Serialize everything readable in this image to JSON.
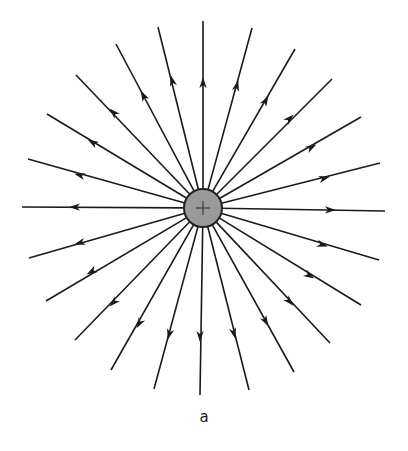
{
  "figure": {
    "caption": "a",
    "charge": {
      "sign": "+",
      "center": [
        203,
        208
      ],
      "radius": 19,
      "fill": "#9a9a9a",
      "stroke": "#222222"
    },
    "line_color": "#1a1a1a",
    "field_lines": [
      {
        "end": [
          203,
          21
        ],
        "arrow": [
          203,
          82
        ]
      },
      {
        "end": [
          158,
          27
        ],
        "arrow": [
          172,
          80
        ]
      },
      {
        "end": [
          252,
          28
        ],
        "arrow": [
          237,
          85
        ]
      },
      {
        "end": [
          116,
          44
        ],
        "arrow": [
          143,
          95
        ]
      },
      {
        "end": [
          295,
          49
        ],
        "arrow": [
          266,
          100
        ]
      },
      {
        "end": [
          76,
          75
        ],
        "arrow": [
          113,
          112
        ]
      },
      {
        "end": [
          332,
          79
        ],
        "arrow": [
          290,
          118
        ]
      },
      {
        "end": [
          47,
          114
        ],
        "arrow": [
          92,
          142
        ]
      },
      {
        "end": [
          361,
          117
        ],
        "arrow": [
          312,
          147
        ]
      },
      {
        "end": [
          28,
          159
        ],
        "arrow": [
          79,
          175
        ]
      },
      {
        "end": [
          380,
          163
        ],
        "arrow": [
          325,
          178
        ]
      },
      {
        "end": [
          22,
          207
        ],
        "arrow": [
          74,
          207
        ]
      },
      {
        "end": [
          385,
          211
        ],
        "arrow": [
          331,
          210
        ]
      },
      {
        "end": [
          29,
          258
        ],
        "arrow": [
          79,
          243
        ]
      },
      {
        "end": [
          379,
          260
        ],
        "arrow": [
          323,
          245
        ]
      },
      {
        "end": [
          46,
          301
        ],
        "arrow": [
          91,
          272
        ]
      },
      {
        "end": [
          361,
          305
        ],
        "arrow": [
          310,
          276
        ]
      },
      {
        "end": [
          75,
          340
        ],
        "arrow": [
          113,
          303
        ]
      },
      {
        "end": [
          330,
          343
        ],
        "arrow": [
          290,
          302
        ]
      },
      {
        "end": [
          111,
          370
        ],
        "arrow": [
          139,
          324
        ]
      },
      {
        "end": [
          294,
          372
        ],
        "arrow": [
          266,
          322
        ]
      },
      {
        "end": [
          154,
          389
        ],
        "arrow": [
          169,
          335
        ]
      },
      {
        "end": [
          249,
          390
        ],
        "arrow": [
          234,
          334
        ]
      },
      {
        "end": [
          200,
          395
        ],
        "arrow": [
          200,
          337
        ]
      }
    ]
  }
}
